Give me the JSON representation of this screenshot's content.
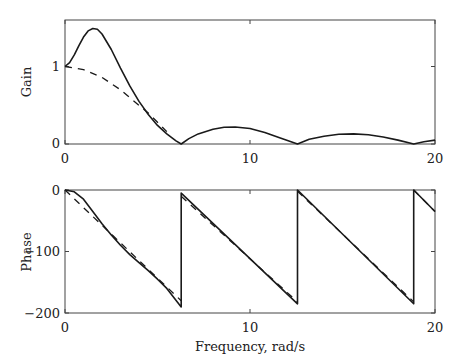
{
  "chart_data": [
    {
      "type": "line",
      "title": "",
      "xlabel": "",
      "ylabel": "Gain",
      "xlim": [
        0,
        20
      ],
      "ylim": [
        0,
        1.6
      ],
      "xticks": [
        "0",
        "10",
        "20"
      ],
      "yticks": [
        "0",
        "1"
      ],
      "grid": false,
      "series": [
        {
          "name": "solid",
          "style": "solid",
          "x": [
            0,
            0.25,
            0.5,
            0.75,
            1.0,
            1.25,
            1.5,
            1.75,
            2.0,
            2.5,
            3.0,
            3.5,
            4.0,
            4.5,
            5.0,
            5.5,
            6.0,
            6.28,
            6.7,
            7.2,
            8.0,
            8.6,
            9.2,
            10.0,
            10.8,
            11.6,
            12.57,
            13.2,
            14.0,
            14.8,
            15.6,
            16.4,
            17.2,
            18.0,
            18.85,
            19.4,
            20.0
          ],
          "values": [
            1.0,
            1.05,
            1.15,
            1.27,
            1.38,
            1.46,
            1.49,
            1.48,
            1.42,
            1.22,
            0.98,
            0.75,
            0.55,
            0.38,
            0.24,
            0.13,
            0.04,
            0.0,
            0.07,
            0.13,
            0.19,
            0.215,
            0.22,
            0.2,
            0.15,
            0.08,
            0.0,
            0.06,
            0.1,
            0.125,
            0.13,
            0.12,
            0.09,
            0.05,
            0.0,
            0.03,
            0.05
          ]
        },
        {
          "name": "dashed",
          "style": "dashed",
          "x": [
            0,
            1,
            2,
            3,
            4,
            4.5,
            5.0,
            5.5
          ],
          "values": [
            1.0,
            0.96,
            0.86,
            0.7,
            0.5,
            0.4,
            0.28,
            0.16
          ]
        }
      ]
    },
    {
      "type": "line",
      "title": "",
      "xlabel": "Frequency, rad/s",
      "ylabel": "Phase",
      "xlim": [
        0,
        20
      ],
      "ylim": [
        -200,
        0
      ],
      "xticks": [
        "0",
        "10",
        "20"
      ],
      "yticks": [
        "0",
        "−100",
        "−200"
      ],
      "grid": false,
      "series": [
        {
          "name": "solid",
          "style": "solid",
          "x": [
            0,
            0.5,
            1.0,
            1.5,
            2.0,
            2.5,
            3.0,
            3.5,
            4.0,
            4.5,
            5.0,
            5.5,
            6.28,
            6.28,
            12.57,
            12.57,
            18.85,
            18.85,
            20.0
          ],
          "values": [
            0,
            -3,
            -15,
            -35,
            -55,
            -73,
            -90,
            -105,
            -118,
            -131,
            -145,
            -160,
            -190,
            -5,
            -185,
            0,
            -185,
            0,
            -35
          ]
        },
        {
          "name": "dashed",
          "style": "dashed",
          "x": [
            0,
            6.28,
            6.28,
            12.57,
            12.57,
            18.85,
            18.85,
            20.0
          ],
          "values": [
            0,
            -180,
            -10,
            -182,
            -2,
            -182,
            0,
            -35
          ]
        }
      ]
    }
  ],
  "labels": {
    "top_ylabel": "Gain",
    "bottom_ylabel": "Phase",
    "xlabel": "Frequency, rad/s",
    "top_xticks": [
      "0",
      "10",
      "20"
    ],
    "top_yticks": [
      "0",
      "1"
    ],
    "bottom_xticks": [
      "0",
      "10",
      "20"
    ],
    "bottom_yticks": [
      "0",
      "−100",
      "−200"
    ]
  }
}
